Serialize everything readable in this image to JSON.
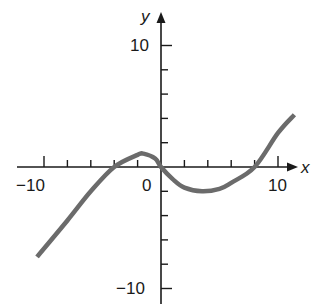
{
  "chart_data": {
    "type": "line",
    "title": "",
    "xlabel": "x",
    "ylabel": "y",
    "xlim": [
      -12,
      12
    ],
    "ylim": [
      -11,
      12
    ],
    "grid": false,
    "legend": null,
    "x_ticks": [
      -10,
      -8,
      -6,
      -4,
      -2,
      0,
      2,
      4,
      6,
      8,
      10
    ],
    "y_ticks": [
      -10,
      -8,
      -6,
      -4,
      -2,
      0,
      2,
      4,
      6,
      8,
      10
    ],
    "x_tick_labels": {
      "-10": "−10",
      "0": "0",
      "10": "10"
    },
    "y_tick_labels": {
      "10": "10",
      "-10": "−10"
    },
    "series": [
      {
        "name": "f(x)",
        "color": "#6b6b6b",
        "points": [
          [
            -10.6,
            -7.4
          ],
          [
            -8,
            -4.4
          ],
          [
            -6,
            -2.0
          ],
          [
            -4,
            0
          ],
          [
            -2,
            1.0
          ],
          [
            -1.5,
            1.1
          ],
          [
            -0.5,
            0.7
          ],
          [
            0,
            0
          ],
          [
            1,
            -1.0
          ],
          [
            2,
            -1.7
          ],
          [
            3.5,
            -2.0
          ],
          [
            5,
            -1.8
          ],
          [
            6,
            -1.3
          ],
          [
            8,
            0
          ],
          [
            10,
            2.8
          ],
          [
            11.4,
            4.3
          ]
        ]
      }
    ],
    "roots": [
      -4,
      0,
      8
    ]
  },
  "labels": {
    "x_axis": "x",
    "y_axis": "y",
    "x_neg10": "−10",
    "x_zero": "0",
    "x_pos10": "10",
    "y_pos10": "10",
    "y_neg10": "−10"
  },
  "colors": {
    "axis": "#1a1a1a",
    "curve": "#6b6b6b"
  }
}
